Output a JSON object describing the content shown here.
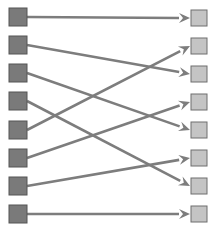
{
  "diagram": {
    "type": "bipartite-mapping",
    "colors": {
      "left_fill": "#7a7a7a",
      "left_stroke": "#555555",
      "right_fill": "#c4c4c4",
      "right_stroke": "#6e6e6e",
      "arrow": "#7d7d7d",
      "background": "#ffffff"
    },
    "left_nodes": [
      {
        "id": "L1",
        "y": 17
      },
      {
        "id": "L2",
        "y": 45
      },
      {
        "id": "L3",
        "y": 73
      },
      {
        "id": "L4",
        "y": 101
      },
      {
        "id": "L5",
        "y": 130
      },
      {
        "id": "L6",
        "y": 158
      },
      {
        "id": "L7",
        "y": 186
      },
      {
        "id": "L8",
        "y": 214
      }
    ],
    "right_nodes": [
      {
        "id": "R1",
        "y": 18
      },
      {
        "id": "R2",
        "y": 46
      },
      {
        "id": "R3",
        "y": 74
      },
      {
        "id": "R4",
        "y": 102
      },
      {
        "id": "R5",
        "y": 130
      },
      {
        "id": "R6",
        "y": 158
      },
      {
        "id": "R7",
        "y": 186
      },
      {
        "id": "R8",
        "y": 214
      }
    ],
    "edges": [
      {
        "from": 0,
        "to": 0
      },
      {
        "from": 1,
        "to": 2
      },
      {
        "from": 2,
        "to": 4
      },
      {
        "from": 3,
        "to": 6
      },
      {
        "from": 4,
        "to": 1
      },
      {
        "from": 5,
        "to": 3
      },
      {
        "from": 6,
        "to": 5
      },
      {
        "from": 7,
        "to": 7
      }
    ]
  }
}
